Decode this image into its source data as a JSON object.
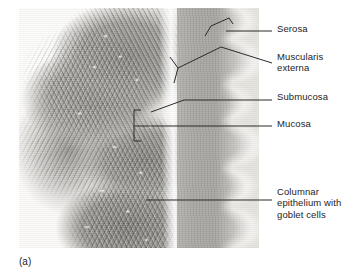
{
  "figure": {
    "caption": "(a)",
    "colors": {
      "leader_line": "#2b2b2b",
      "text": "#1d1d1d",
      "background": "#ffffff",
      "mucosa": "#9a9893",
      "muscularis_externa": "#a8a6a1",
      "submucosa": "#f4f3f0",
      "lumen": "#fbfaf8"
    }
  },
  "labels": [
    {
      "id": "serosa",
      "text": "Serosa",
      "x": 277,
      "y": 23
    },
    {
      "id": "muscularis",
      "text": "Muscularis\nexterna",
      "x": 277,
      "y": 51
    },
    {
      "id": "submucosa",
      "text": "Submucosa",
      "x": 277,
      "y": 91
    },
    {
      "id": "mucosa",
      "text": "Mucosa",
      "x": 277,
      "y": 118
    },
    {
      "id": "columnar",
      "text": "Columnar\nepithelium with\ngoblet cells",
      "x": 277,
      "y": 186
    }
  ],
  "tissue_regions": [
    {
      "id": "serosa",
      "name": "Serosa"
    },
    {
      "id": "muscularis-externa",
      "name": "Muscularis externa"
    },
    {
      "id": "submucosa",
      "name": "Submucosa"
    },
    {
      "id": "mucosa",
      "name": "Mucosa"
    },
    {
      "id": "columnar-epithelium",
      "name": "Columnar epithelium with goblet cells"
    },
    {
      "id": "lumen",
      "name": "Lumen"
    }
  ]
}
